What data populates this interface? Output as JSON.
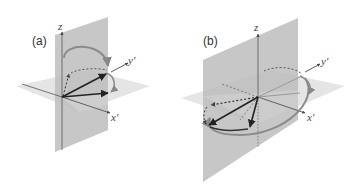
{
  "panels": [
    {
      "id": "a",
      "label": "(a)",
      "axes": {
        "z": "z",
        "x": "x′",
        "y": "y′"
      }
    },
    {
      "id": "b",
      "label": "(b)",
      "axes": {
        "z": "z",
        "x": "x′",
        "y": "y′"
      }
    }
  ],
  "colors": {
    "vertical_plane": "#b8b8b8",
    "horizontal_plane": "#dedede",
    "axis": "#555555",
    "vector": "#222222",
    "arc": "#8c8c8c",
    "dotted": "#555555"
  }
}
